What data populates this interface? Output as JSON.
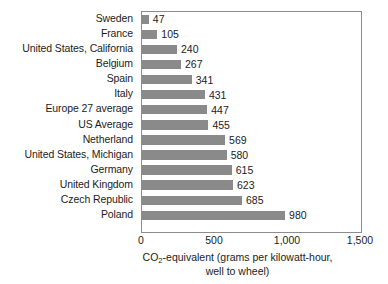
{
  "chart_data": {
    "type": "bar",
    "orientation": "horizontal",
    "title": "",
    "subtitle": "",
    "xlabel": "CO2-equivalent (grams per kilowatt-hour, well to wheel)",
    "xlabel_parts": {
      "lead": "CO",
      "sub": "2",
      "rest": "-equivalent (grams per kilowatt-hour,",
      "line2": "well to wheel)"
    },
    "ylabel": "",
    "xlim": [
      0,
      1500
    ],
    "xticks": [
      0,
      500,
      1000,
      1500
    ],
    "xtick_labels": [
      "0",
      "500",
      "1,000",
      "1,500"
    ],
    "grid": false,
    "legend": null,
    "bar_color": "#8a8a8a",
    "frame_color": "#8d8d8d",
    "categories": [
      "Sweden",
      "France",
      "United States, California",
      "Belgium",
      "Spain",
      "Italy",
      "Europe 27 average",
      "US Average",
      "Netherland",
      "United States, Michigan",
      "Germany",
      "United Kingdom",
      "Czech Republic",
      "Poland"
    ],
    "values": [
      47,
      105,
      240,
      267,
      341,
      431,
      447,
      455,
      569,
      580,
      615,
      623,
      685,
      980
    ],
    "value_labels": [
      "47",
      "105",
      "240",
      "267",
      "341",
      "431",
      "447",
      "455",
      "569",
      "580",
      "615",
      "623",
      "685",
      "980"
    ]
  }
}
